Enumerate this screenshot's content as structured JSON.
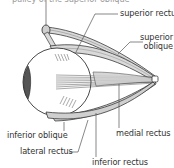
{
  "diagram": {
    "labels": {
      "top_cut": "pulley of the superior oblique",
      "superior_rectus": "superior rectus",
      "superior_oblique_line1": "superior",
      "superior_oblique_line2": "oblique",
      "inferior_oblique": "inferior oblique",
      "lateral_rectus": "lateral rectus",
      "medial_rectus": "medial rectus",
      "inferior_rectus": "inferior rectus"
    },
    "colors": {
      "muscle_fill": "#d9d9d9",
      "muscle_stroke": "#3a3a3a",
      "eyeball_fill": "#ffffff",
      "cornea_fill": "#555555",
      "leader_line": "#555555",
      "text": "#333333"
    }
  }
}
